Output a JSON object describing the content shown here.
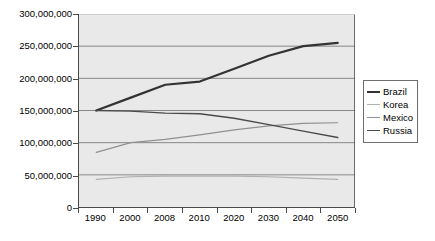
{
  "chart_data": {
    "type": "line",
    "title": "",
    "subtitle": "",
    "xlabel": "",
    "ylabel": "",
    "grid": true,
    "legend_position": "right",
    "ylim": [
      0,
      300000000
    ],
    "y_ticks": [
      0,
      50000000,
      100000000,
      150000000,
      200000000,
      250000000,
      300000000
    ],
    "y_tick_labels": [
      "0",
      "50,000,000",
      "100,000,000",
      "150,000,000",
      "200,000,000",
      "250,000,000",
      "300,000,000"
    ],
    "categories": [
      "1990",
      "2000",
      "2008",
      "2010",
      "2020",
      "2030",
      "2040",
      "2050"
    ],
    "series": [
      {
        "name": "Brazil",
        "color": "#333333",
        "width": 2.2,
        "values": [
          150000000,
          170000000,
          190000000,
          195000000,
          215000000,
          235000000,
          250000000,
          255000000
        ]
      },
      {
        "name": "Korea",
        "color": "#b0b0b0",
        "width": 1.2,
        "values": [
          43000000,
          47000000,
          48000000,
          48000000,
          48000000,
          47000000,
          45000000,
          43000000
        ]
      },
      {
        "name": "Mexico",
        "color": "#909090",
        "width": 1.2,
        "values": [
          85000000,
          100000000,
          105000000,
          112000000,
          120000000,
          126000000,
          130000000,
          131000000
        ]
      },
      {
        "name": "Russia",
        "color": "#4a4a4a",
        "width": 1.4,
        "values": [
          150000000,
          149000000,
          146000000,
          145000000,
          138000000,
          128000000,
          118000000,
          108000000
        ]
      }
    ]
  },
  "colors": {
    "plot_background": "#e9e9e9",
    "axis": "#4a4a4a",
    "gridline": "#6e6e6e",
    "legend_border": "#6e6e6e",
    "page_background": "#ffffff"
  }
}
